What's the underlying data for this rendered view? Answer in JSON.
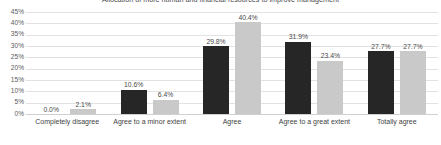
{
  "chart_data": {
    "type": "bar",
    "title": "Allocation of more human and financial resources to improve management",
    "xlabel": "",
    "ylabel": "",
    "ylim": [
      0,
      45
    ],
    "grid": true,
    "legend": "none",
    "categories": [
      "Completely disagree",
      "Agree to a minor extent",
      "Agree",
      "Agree to a great extent",
      "Totally agree"
    ],
    "ytick_labels": [
      "45%",
      "40%",
      "35%",
      "30%",
      "25%",
      "20%",
      "15%",
      "10%",
      "5%",
      "0%"
    ],
    "ytick_values": [
      45,
      40,
      35,
      30,
      25,
      20,
      15,
      10,
      5,
      0
    ],
    "series": [
      {
        "name": "Series 1",
        "color": "#262626",
        "values": [
          0.0,
          10.6,
          29.8,
          31.9,
          27.7
        ],
        "labels": [
          "0.0%",
          "10.6%",
          "29.8%",
          "31.9%",
          "27.7%"
        ]
      },
      {
        "name": "Series 2",
        "color": "#c9c9c9",
        "values": [
          2.1,
          6.4,
          40.4,
          23.4,
          27.7
        ],
        "labels": [
          "2.1%",
          "6.4%",
          "40.4%",
          "23.4%",
          "27.7%"
        ]
      }
    ]
  }
}
